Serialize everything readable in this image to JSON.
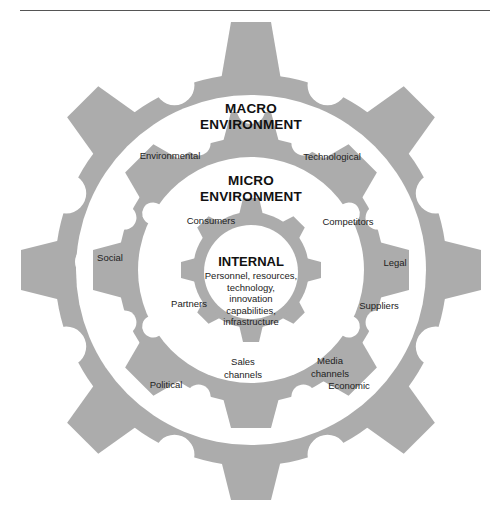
{
  "colors": {
    "gear": "#acacac",
    "background": "#ffffff",
    "text": "#1a1a1a",
    "rule": "#555555"
  },
  "macro": {
    "title_line1": "MACRO",
    "title_line2": "ENVIRONMENT",
    "factors": [
      "Environmental",
      "Technological",
      "Social",
      "Legal",
      "Political",
      "Economic"
    ]
  },
  "micro": {
    "title_line1": "MICRO",
    "title_line2": "ENVIRONMENT",
    "factors": [
      "Consumers",
      "Competitors",
      "Partners",
      "Suppliers",
      "Sales channels",
      "Media channels"
    ],
    "sales_line1": "Sales",
    "sales_line2": "channels",
    "media_line1": "Media",
    "media_line2": "channels"
  },
  "internal": {
    "title": "INTERNAL",
    "lines": [
      "Personnel, resources,",
      "technology,",
      "innovation",
      "capabilities,",
      "infrastructure"
    ]
  }
}
